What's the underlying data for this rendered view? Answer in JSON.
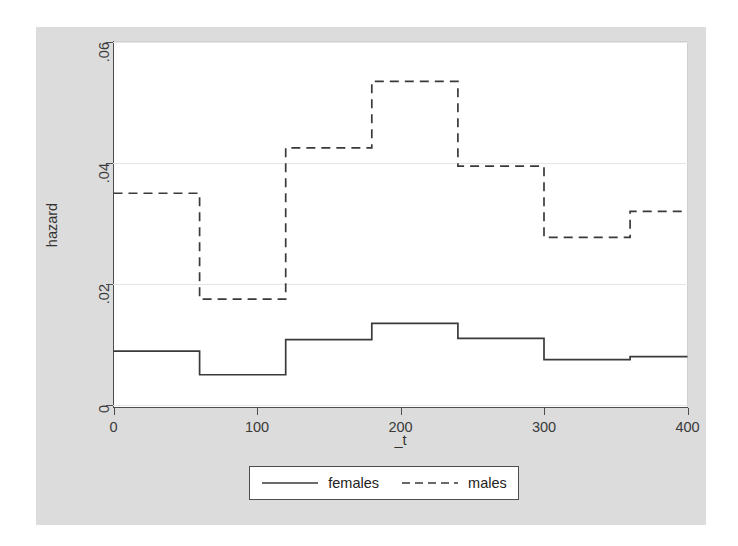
{
  "figure": {
    "background_color": "#dcdcdc",
    "plot_background_color": "#ffffff"
  },
  "axes": {
    "y": {
      "title": "hazard",
      "ticks": [
        "0",
        ".02",
        ".04",
        ".06"
      ],
      "tick_values": [
        0,
        0.02,
        0.04,
        0.06
      ],
      "limits": [
        0,
        0.06
      ],
      "gridlines": true
    },
    "x": {
      "title": "_t",
      "ticks": [
        "0",
        "100",
        "200",
        "300",
        "400"
      ],
      "tick_values": [
        0,
        100,
        200,
        300,
        400
      ],
      "limits": [
        0,
        400
      ],
      "gridlines": false
    }
  },
  "legend": {
    "entries": [
      {
        "label": "females",
        "style": "solid",
        "color": "#3a3a3a"
      },
      {
        "label": "males",
        "style": "dashed",
        "color": "#3a3a3a"
      }
    ]
  },
  "chart_data": {
    "type": "line",
    "subtype": "step-post",
    "title": "",
    "subtitle": "",
    "xlabel": "_t",
    "ylabel": "hazard",
    "xlim": [
      0,
      400
    ],
    "ylim": [
      0,
      0.06
    ],
    "xticks": [
      0,
      100,
      200,
      300,
      400
    ],
    "yticks": [
      0,
      0.02,
      0.04,
      0.06
    ],
    "grid": "horizontal",
    "legend_position": "bottom",
    "interval_edges": [
      0,
      60,
      120,
      180,
      240,
      300,
      360,
      400
    ],
    "series": [
      {
        "name": "females",
        "style": "solid",
        "color": "#3a3a3a",
        "values": [
          0.0089,
          0.005,
          0.0108,
          0.0135,
          0.011,
          0.0075,
          0.008
        ]
      },
      {
        "name": "males",
        "style": "dashed",
        "color": "#3a3a3a",
        "values": [
          0.035,
          0.0175,
          0.0425,
          0.0535,
          0.0395,
          0.0277,
          0.032
        ]
      }
    ]
  }
}
